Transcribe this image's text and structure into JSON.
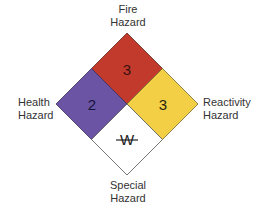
{
  "labels": {
    "fire": [
      "Fire",
      "Hazard"
    ],
    "health": [
      "Health",
      "Hazard"
    ],
    "reactivity": [
      "Reactivity",
      "Hazard"
    ],
    "special": [
      "Special",
      "Hazard"
    ]
  },
  "quadrants": {
    "fire": {
      "value": "3",
      "color": "#c0392b"
    },
    "health": {
      "value": "2",
      "color": "#6a54a3"
    },
    "reactivity": {
      "value": "3",
      "color": "#f2cf45"
    },
    "special": {
      "value": "W",
      "color": "#ffffff"
    }
  }
}
